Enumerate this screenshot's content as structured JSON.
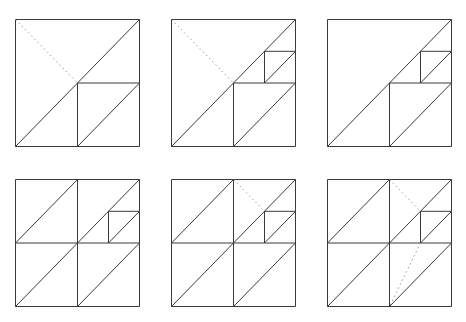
{
  "figure": {
    "colors": {
      "line": "#3a3a3a",
      "dotted": "#9a9a9a",
      "background": "#ffffff"
    },
    "panel_size": {
      "width": 124,
      "height": 127
    },
    "panels": [
      {
        "id": "panel-1",
        "x": 15,
        "y": 19,
        "solid": [
          [
            0,
            0,
            1,
            0
          ],
          [
            1,
            0,
            1,
            1
          ],
          [
            1,
            1,
            0,
            1
          ],
          [
            0,
            1,
            0,
            0
          ],
          [
            0,
            1,
            1,
            0
          ],
          [
            0.5,
            0.5,
            0.5,
            1
          ],
          [
            0.5,
            0.5,
            1,
            0.5
          ],
          [
            0.5,
            1,
            1,
            0.5
          ]
        ],
        "dotted": [
          [
            0,
            0,
            0.5,
            0.5
          ]
        ]
      },
      {
        "id": "panel-2",
        "x": 171,
        "y": 19,
        "solid": [
          [
            0,
            0,
            1,
            0
          ],
          [
            1,
            0,
            1,
            1
          ],
          [
            1,
            1,
            0,
            1
          ],
          [
            0,
            1,
            0,
            0
          ],
          [
            0,
            1,
            1,
            0
          ],
          [
            0.5,
            0.5,
            0.5,
            1
          ],
          [
            0.5,
            0.5,
            1,
            0.5
          ],
          [
            0.5,
            1,
            1,
            0.5
          ],
          [
            0.75,
            0.25,
            0.75,
            0.5
          ],
          [
            0.75,
            0.25,
            1,
            0.25
          ],
          [
            0.75,
            0.5,
            1,
            0.25
          ]
        ],
        "dotted": [
          [
            0,
            0,
            0.5,
            0.5
          ]
        ]
      },
      {
        "id": "panel-3",
        "x": 327,
        "y": 19,
        "solid": [
          [
            0,
            0,
            1,
            0
          ],
          [
            1,
            0,
            1,
            1
          ],
          [
            1,
            1,
            0,
            1
          ],
          [
            0,
            1,
            0,
            0
          ],
          [
            0,
            1,
            1,
            0
          ],
          [
            0.5,
            0.5,
            0.5,
            1
          ],
          [
            0.5,
            0.5,
            1,
            0.5
          ],
          [
            0.5,
            1,
            1,
            0.5
          ],
          [
            0.75,
            0.25,
            0.75,
            0.5
          ],
          [
            0.75,
            0.25,
            1,
            0.25
          ],
          [
            0.75,
            0.5,
            1,
            0.25
          ]
        ],
        "dotted": []
      },
      {
        "id": "panel-4",
        "x": 15,
        "y": 179,
        "solid": [
          [
            0,
            0,
            1,
            0
          ],
          [
            1,
            0,
            1,
            1
          ],
          [
            1,
            1,
            0,
            1
          ],
          [
            0,
            1,
            0,
            0
          ],
          [
            0.5,
            0,
            0.5,
            1
          ],
          [
            0,
            0.5,
            1,
            0.5
          ],
          [
            0,
            0.5,
            0.5,
            0
          ],
          [
            0.5,
            0.5,
            1,
            0
          ],
          [
            0,
            1,
            0.5,
            0.5
          ],
          [
            0.5,
            1,
            1,
            0.5
          ],
          [
            0.75,
            0.25,
            0.75,
            0.5
          ],
          [
            0.75,
            0.25,
            1,
            0.25
          ],
          [
            0.75,
            0.5,
            1,
            0.25
          ]
        ],
        "dotted": []
      },
      {
        "id": "panel-5",
        "x": 171,
        "y": 179,
        "solid": [
          [
            0,
            0,
            1,
            0
          ],
          [
            1,
            0,
            1,
            1
          ],
          [
            1,
            1,
            0,
            1
          ],
          [
            0,
            1,
            0,
            0
          ],
          [
            0.5,
            0,
            0.5,
            1
          ],
          [
            0,
            0.5,
            1,
            0.5
          ],
          [
            0,
            0.5,
            0.5,
            0
          ],
          [
            0.5,
            0.5,
            1,
            0
          ],
          [
            0,
            1,
            0.5,
            0.5
          ],
          [
            0.5,
            1,
            1,
            0.5
          ],
          [
            0.75,
            0.25,
            0.75,
            0.5
          ],
          [
            0.75,
            0.25,
            1,
            0.25
          ],
          [
            0.75,
            0.5,
            1,
            0.25
          ]
        ],
        "dotted": [
          [
            0.5,
            0,
            0.75,
            0.25
          ]
        ]
      },
      {
        "id": "panel-6",
        "x": 327,
        "y": 179,
        "solid": [
          [
            0,
            0,
            1,
            0
          ],
          [
            1,
            0,
            1,
            1
          ],
          [
            1,
            1,
            0,
            1
          ],
          [
            0,
            1,
            0,
            0
          ],
          [
            0.5,
            0,
            0.5,
            1
          ],
          [
            0,
            0.5,
            1,
            0.5
          ],
          [
            0,
            0.5,
            0.5,
            0
          ],
          [
            0.5,
            0.5,
            1,
            0
          ],
          [
            0,
            1,
            0.5,
            0.5
          ],
          [
            0.5,
            1,
            1,
            0.5
          ],
          [
            0.75,
            0.25,
            0.75,
            0.5
          ],
          [
            0.75,
            0.25,
            1,
            0.25
          ],
          [
            0.75,
            0.5,
            1,
            0.25
          ]
        ],
        "dotted": [
          [
            0.5,
            0,
            0.75,
            0.25
          ],
          [
            0.75,
            0.5,
            0.5,
            1
          ]
        ]
      }
    ]
  }
}
